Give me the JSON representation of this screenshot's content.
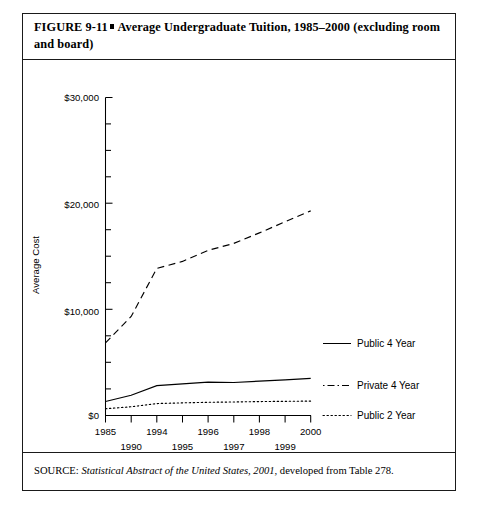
{
  "figure": {
    "label": "FIGURE  9-11",
    "marker": "square-bullet",
    "title": "Average Undergraduate Tuition, 1985–2000 (excluding room and board)",
    "caption_line1": "FIGURE  9-11",
    "caption_line2": "Average Undergraduate Tuition, 1985–2000 (excluding room and board)"
  },
  "source": {
    "prefix": "SOURCE:",
    "italic_part": "Statistical Abstract of the United States, 2001",
    "suffix": ", developed from Table 278."
  },
  "chart_data": {
    "type": "line",
    "title": "Average Undergraduate Tuition, 1985–2000 (excluding room and board)",
    "xlabel": "Year",
    "ylabel": "Average Cost",
    "x": [
      1985,
      1990,
      1994,
      1995,
      1996,
      1997,
      1998,
      1999,
      2000
    ],
    "categories": [
      "1985",
      "1990",
      "1994",
      "1995",
      "1996",
      "1997",
      "1998",
      "1999",
      "2000"
    ],
    "xtick_labels_upper": [
      "1985",
      "1994",
      "1996",
      "1998",
      "2000"
    ],
    "xtick_labels_lower": [
      "1990",
      "1995",
      "1997",
      "1999"
    ],
    "ytick_labels": [
      "$0",
      "$10,000",
      "$20,000",
      "$30,000"
    ],
    "ytick_values": [
      0,
      10000,
      20000,
      30000
    ],
    "yminor_interval": 2500,
    "ylim": [
      0,
      30000
    ],
    "grid": false,
    "legend_position": "right",
    "series": [
      {
        "name": "Public 4 Year",
        "style": "solid",
        "values": [
          1318,
          1908,
          2820,
          2977,
          3151,
          3111,
          3243,
          3356,
          3501
        ]
      },
      {
        "name": "Private 4 Year",
        "style": "dashed",
        "values": [
          6843,
          9340,
          13874,
          14537,
          15581,
          16233,
          17229,
          18273,
          19307
        ]
      },
      {
        "name": "Public 2 Year",
        "style": "dotted",
        "values": [
          641,
          824,
          1125,
          1192,
          1245,
          1276,
          1314,
          1336,
          1359
        ]
      }
    ]
  },
  "legend": {
    "items": [
      {
        "label": "Public 4 Year",
        "style": "solid"
      },
      {
        "label": "Private 4 Year",
        "style": "dash-dot"
      },
      {
        "label": "Public 2 Year",
        "style": "dotted"
      }
    ]
  }
}
